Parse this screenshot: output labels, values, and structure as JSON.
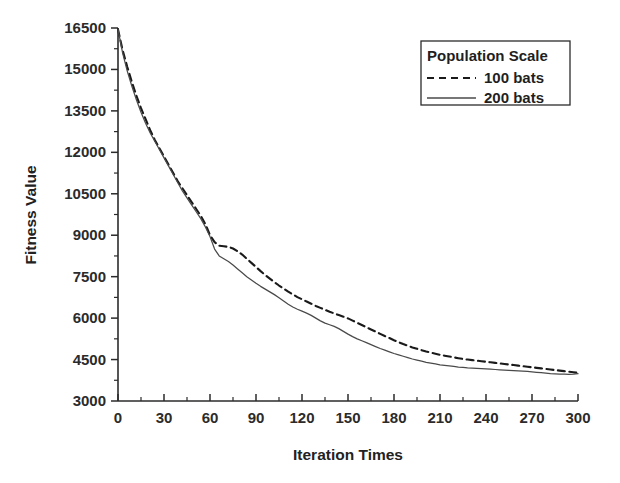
{
  "chart_data": {
    "type": "line",
    "title": "",
    "xlabel": "Iteration Times",
    "ylabel": "Fitness Value",
    "xlim": [
      0,
      300
    ],
    "ylim": [
      3000,
      16500
    ],
    "xticks": [
      0,
      30,
      60,
      90,
      120,
      150,
      180,
      210,
      240,
      270,
      300
    ],
    "yticks": [
      3000,
      4500,
      6000,
      7500,
      9000,
      10500,
      12000,
      13500,
      15000,
      16500
    ],
    "xtick_labels": [
      "0",
      "30",
      "60",
      "90",
      "120",
      "150",
      "180",
      "210",
      "240",
      "270",
      "300"
    ],
    "ytick_labels": [
      "3000",
      "4500",
      "6000",
      "7500",
      "9000",
      "10500",
      "12000",
      "13500",
      "15000",
      "16500"
    ],
    "grid": false,
    "minor_ticks": true,
    "legend_position": "top-right",
    "legend_title": "Population Scale",
    "series": [
      {
        "name": "100 bats",
        "style": "dashed",
        "color": "#1a1a1a",
        "x": [
          0,
          3,
          6,
          9,
          12,
          15,
          18,
          21,
          24,
          27,
          30,
          33,
          36,
          39,
          42,
          45,
          48,
          51,
          54,
          57,
          60,
          63,
          66,
          69,
          72,
          75,
          78,
          81,
          84,
          87,
          90,
          93,
          96,
          99,
          102,
          105,
          108,
          111,
          114,
          117,
          120,
          123,
          126,
          129,
          132,
          135,
          138,
          141,
          144,
          147,
          150,
          153,
          156,
          159,
          162,
          165,
          168,
          171,
          174,
          177,
          180,
          183,
          186,
          189,
          192,
          195,
          198,
          201,
          204,
          207,
          210,
          213,
          216,
          219,
          222,
          225,
          228,
          231,
          234,
          237,
          240,
          243,
          246,
          249,
          252,
          255,
          258,
          261,
          264,
          267,
          270,
          273,
          276,
          279,
          282,
          285,
          288,
          291,
          294,
          297,
          300
        ],
        "y": [
          16450,
          15700,
          15100,
          14550,
          14050,
          13600,
          13200,
          12800,
          12450,
          12150,
          11850,
          11550,
          11250,
          10950,
          10700,
          10450,
          10200,
          9950,
          9700,
          9400,
          9000,
          8750,
          8620,
          8600,
          8580,
          8520,
          8420,
          8300,
          8150,
          8000,
          7850,
          7700,
          7560,
          7430,
          7300,
          7180,
          7070,
          6960,
          6860,
          6760,
          6680,
          6600,
          6520,
          6440,
          6370,
          6300,
          6230,
          6170,
          6110,
          6050,
          5990,
          5910,
          5830,
          5750,
          5670,
          5590,
          5510,
          5430,
          5350,
          5280,
          5200,
          5130,
          5060,
          5000,
          4940,
          4890,
          4840,
          4790,
          4750,
          4710,
          4670,
          4640,
          4610,
          4580,
          4550,
          4520,
          4500,
          4480,
          4460,
          4440,
          4420,
          4400,
          4380,
          4360,
          4340,
          4320,
          4300,
          4280,
          4260,
          4240,
          4220,
          4200,
          4180,
          4160,
          4140,
          4120,
          4100,
          4080,
          4060,
          4040,
          4020
        ]
      },
      {
        "name": "200 bats",
        "style": "solid",
        "color": "#4a4a4a",
        "x": [
          0,
          3,
          6,
          9,
          12,
          15,
          18,
          21,
          24,
          27,
          30,
          33,
          36,
          39,
          42,
          45,
          48,
          51,
          54,
          57,
          60,
          63,
          66,
          69,
          72,
          75,
          78,
          81,
          84,
          87,
          90,
          93,
          96,
          99,
          102,
          105,
          108,
          111,
          114,
          117,
          120,
          123,
          126,
          129,
          132,
          135,
          138,
          141,
          144,
          147,
          150,
          153,
          156,
          159,
          162,
          165,
          168,
          171,
          174,
          177,
          180,
          183,
          186,
          189,
          192,
          195,
          198,
          201,
          204,
          207,
          210,
          213,
          216,
          219,
          222,
          225,
          228,
          231,
          234,
          237,
          240,
          243,
          246,
          249,
          252,
          255,
          258,
          261,
          264,
          267,
          270,
          273,
          276,
          279,
          282,
          285,
          288,
          291,
          294,
          297,
          300
        ],
        "y": [
          16450,
          15600,
          14950,
          14400,
          13900,
          13450,
          13050,
          12700,
          12400,
          12100,
          11800,
          11500,
          11200,
          10900,
          10600,
          10350,
          10100,
          9850,
          9600,
          9300,
          8950,
          8500,
          8250,
          8150,
          8050,
          7920,
          7780,
          7640,
          7500,
          7380,
          7260,
          7150,
          7050,
          6950,
          6850,
          6740,
          6620,
          6500,
          6400,
          6320,
          6250,
          6180,
          6100,
          6000,
          5900,
          5820,
          5760,
          5700,
          5620,
          5520,
          5420,
          5330,
          5250,
          5180,
          5110,
          5040,
          4970,
          4900,
          4840,
          4780,
          4720,
          4670,
          4620,
          4570,
          4520,
          4480,
          4440,
          4400,
          4370,
          4340,
          4310,
          4290,
          4270,
          4250,
          4230,
          4215,
          4200,
          4190,
          4180,
          4170,
          4160,
          4150,
          4140,
          4130,
          4120,
          4110,
          4100,
          4090,
          4080,
          4070,
          4055,
          4040,
          4025,
          4010,
          3995,
          3985,
          3975,
          3970,
          3965,
          3970,
          3990
        ]
      }
    ]
  },
  "legend": {
    "title": "Population Scale",
    "entries": [
      {
        "label": "100 bats",
        "style": "dashed"
      },
      {
        "label": "200 bats",
        "style": "solid"
      }
    ]
  },
  "axes": {
    "x_title": "Iteration Times",
    "y_title": "Fitness Value"
  }
}
